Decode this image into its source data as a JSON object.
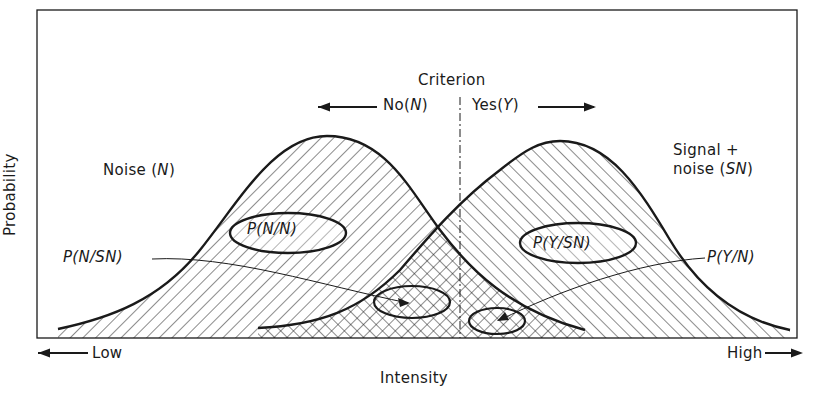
{
  "diagram": {
    "type": "signal-detection-theory",
    "y_axis_label": "Probability",
    "x_axis_label": "Intensity",
    "x_axis_low": "Low",
    "x_axis_high": "High",
    "criterion": {
      "title": "Criterion",
      "left_response": "No",
      "left_response_symbol": "N",
      "right_response": "Yes",
      "right_response_symbol": "Y"
    },
    "distributions": [
      {
        "name": "Noise",
        "symbol": "N",
        "label_line1": "Noise",
        "label_symbol": "N"
      },
      {
        "name": "Signal + noise",
        "symbol": "SN",
        "label_line1": "Signal +",
        "label_line2": "noise",
        "label_symbol": "SN"
      }
    ],
    "regions": {
      "correct_rejection": "P(N/N)",
      "hit": "P(Y/SN)",
      "miss": "P(N/SN)",
      "false_alarm": "P(Y/N)"
    },
    "colors": {
      "ink": "#1a1a1a",
      "background": "#ffffff"
    }
  }
}
